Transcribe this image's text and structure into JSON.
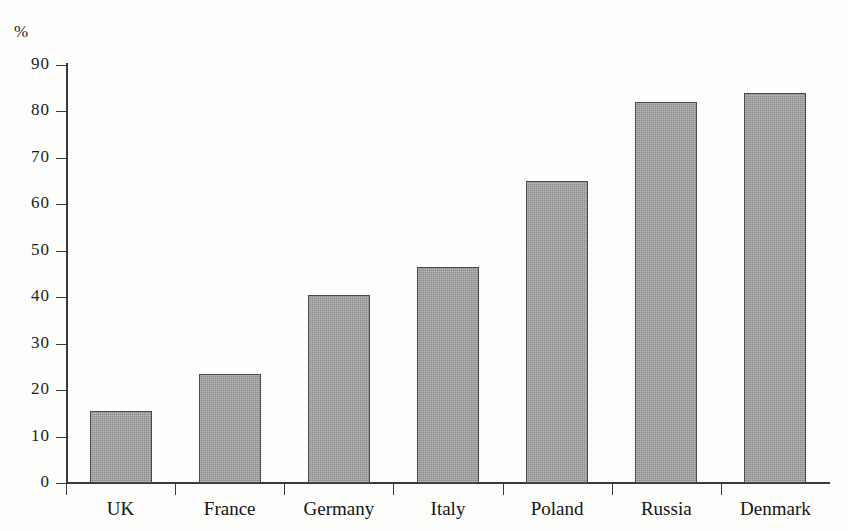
{
  "chart_data": {
    "type": "bar",
    "title": "",
    "subtitle": "",
    "xlabel": "",
    "ylabel": "%",
    "categories": [
      "UK",
      "France",
      "Germany",
      "Italy",
      "Poland",
      "Russia",
      "Denmark"
    ],
    "values": [
      15.5,
      23.5,
      40.5,
      46.5,
      65,
      82,
      84
    ],
    "series": [
      {
        "name": "",
        "values": [
          15.5,
          23.5,
          40.5,
          46.5,
          65,
          82,
          84
        ]
      }
    ],
    "ylim": [
      0,
      90
    ],
    "y_ticks": [
      0,
      10,
      20,
      30,
      40,
      50,
      60,
      70,
      80,
      90
    ],
    "y_tick_labels": [
      "0",
      "10",
      "20",
      "30",
      "40",
      "50",
      "60",
      "70",
      "80",
      "90"
    ],
    "grid": false,
    "legend": false,
    "legend_position": "none",
    "bar_color": "#8c8c8a",
    "bar_edge_color": "#4a4a48",
    "axis_color": "#3a3a38",
    "background_color": "#fdfdfc",
    "annotations": []
  },
  "axis": {
    "unit_label": "%"
  }
}
